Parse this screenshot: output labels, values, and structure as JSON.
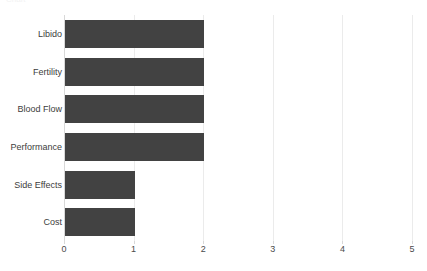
{
  "chart_data": {
    "type": "bar",
    "orientation": "horizontal",
    "title": "",
    "xlabel": "",
    "ylabel": "",
    "categories": [
      "Libido",
      "Fertility",
      "Blood Flow",
      "Performance",
      "Side Effects",
      "Cost"
    ],
    "values": [
      2,
      2,
      2,
      2,
      1,
      1
    ],
    "xlim": [
      0,
      5
    ],
    "xticks": [
      "0",
      "1",
      "2",
      "3",
      "4",
      "5"
    ],
    "xtick_values": [
      0,
      1,
      2,
      3,
      4,
      5
    ],
    "grid": true,
    "grid_axis": "x",
    "legend": false,
    "series": [
      {
        "name": "",
        "values": [
          2,
          2,
          2,
          2,
          1,
          1
        ]
      }
    ],
    "colors": {
      "bar": "#424242",
      "gridline": "#ebebeb",
      "axis": "#d8d8d8",
      "tick_text": "#4a4a4a",
      "category_text": "#3d3d3d",
      "background": "#ffffff"
    }
  },
  "header": {
    "truncated_text": "Chart"
  }
}
